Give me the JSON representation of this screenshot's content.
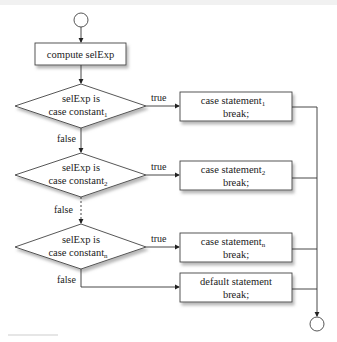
{
  "diagram": {
    "type": "flowchart",
    "start_node": {
      "shape": "circle"
    },
    "end_node": {
      "shape": "circle"
    },
    "compute_box": {
      "label": "compute selExp"
    },
    "decisions": [
      {
        "line1": "selExp is",
        "line2": "case constant",
        "sub": "1",
        "true_label": "true",
        "false_label": "false"
      },
      {
        "line1": "selExp is",
        "line2": "case constant",
        "sub": "2",
        "true_label": "true",
        "false_label": "false"
      },
      {
        "line1": "selExp is",
        "line2": "case constant",
        "sub": "n",
        "true_label": "true",
        "false_label": "false"
      }
    ],
    "case_boxes": [
      {
        "line1": "case statement",
        "sub": "1",
        "line2": "break;"
      },
      {
        "line1": "case statement",
        "sub": "2",
        "line2": "break;"
      },
      {
        "line1": "case statement",
        "sub": "n",
        "line2": "break;"
      }
    ],
    "default_box": {
      "line1": "default statement",
      "line2": "break;"
    },
    "ellipsis": "⋮",
    "colors": {
      "stroke": "#333333",
      "shadow": "#bbbbbb",
      "fill": "#ffffff"
    }
  }
}
